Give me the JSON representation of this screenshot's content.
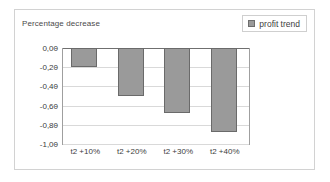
{
  "chart_data": {
    "type": "bar",
    "title": "Percentage decrease",
    "xlabel": "",
    "ylabel": "",
    "categories": [
      "t2 +10%",
      "t2 +20%",
      "t2 +30%",
      "t2 +40%"
    ],
    "series": [
      {
        "name": "profit trend",
        "values": [
          -0.2,
          -0.5,
          -0.68,
          -0.88
        ]
      }
    ],
    "ylim": [
      -1.0,
      0.0
    ],
    "ytick_labels": [
      "0,00",
      "-0,20",
      "-0,40",
      "-0,60",
      "-0,80",
      "-1,00"
    ],
    "ytick_values": [
      0.0,
      -0.2,
      -0.4,
      -0.6,
      -0.8,
      -1.0
    ],
    "grid": true,
    "legend": {
      "position": "top-right",
      "entries": [
        {
          "label": "profit trend",
          "marker": "square",
          "color": "#9a9a9a"
        }
      ]
    },
    "colors": {
      "bar_fill": "#9a9a9a",
      "bar_border": "#6a6a6a",
      "gridline": "#d9d9d9",
      "axis": "#9f9f9f",
      "frame": "#d2d2d2",
      "text": "#3d3d3d"
    }
  }
}
